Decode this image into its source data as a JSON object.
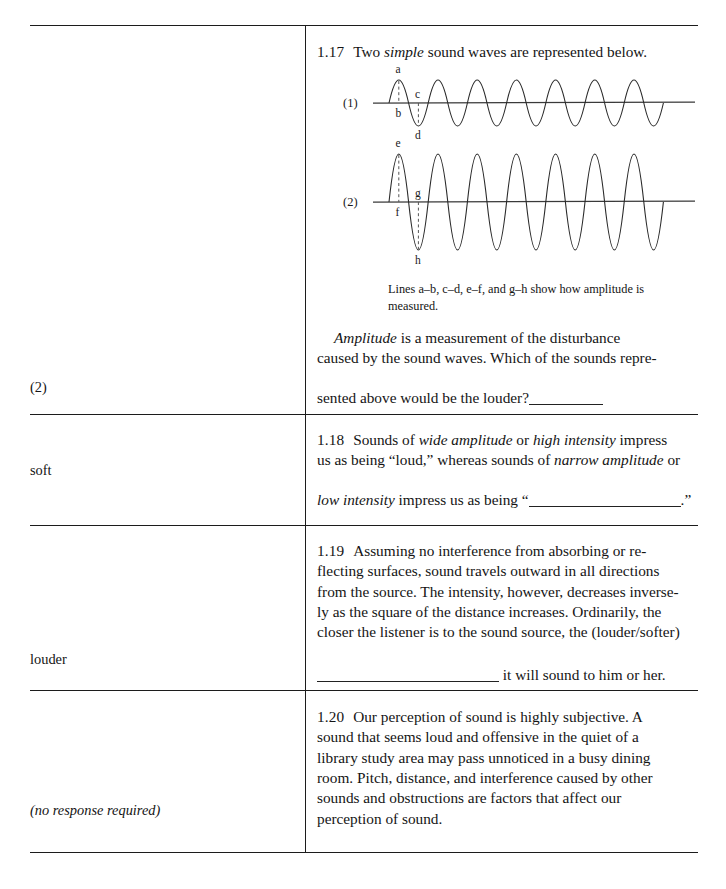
{
  "document": {
    "type": "programmed-instruction-workbook-page",
    "answer_column_header": "",
    "frames": [
      {
        "id": "1.17",
        "number": "1.17",
        "answer": "(2)",
        "answer_style": "plain",
        "lines": [
          {
            "segments": [
              {
                "text": "Two ",
                "style": "plain"
              },
              {
                "text": "simple",
                "style": "italic"
              },
              {
                "text": " sound waves are represented below.",
                "style": "plain"
              }
            ]
          }
        ],
        "figure": {
          "caption": "Lines a–b, c–d, e–f, and g–h show how amplitude is measured.",
          "waves": [
            {
              "label": "(1)",
              "cycles": 6.5,
              "amplitude_px": 23,
              "description": "narrow amplitude / low intensity wave",
              "point_labels": [
                {
                  "name": "a",
                  "position": "above first crest"
                },
                {
                  "name": "b",
                  "position": "below axis at first crest"
                },
                {
                  "name": "c",
                  "position": "above axis at first trough"
                },
                {
                  "name": "d",
                  "position": "below first trough"
                }
              ]
            },
            {
              "label": "(2)",
              "cycles": 6.5,
              "amplitude_px": 48,
              "description": "wide amplitude / high intensity wave",
              "point_labels": [
                {
                  "name": "e",
                  "position": "above first crest"
                },
                {
                  "name": "f",
                  "position": "below axis at first crest"
                },
                {
                  "name": "g",
                  "position": "above axis at first trough"
                },
                {
                  "name": "h",
                  "position": "below first trough"
                }
              ]
            }
          ]
        },
        "body": {
          "line1_italic": "Amplitude",
          "line1_rest": " is a measurement of the disturbance",
          "line2": "caused by the sound waves. Which of the sounds repre-",
          "line3": "sented above would be the louder?"
        }
      },
      {
        "id": "1.18",
        "number": "1.18",
        "answer": "soft",
        "answer_style": "plain",
        "text_line1_a": "Sounds of ",
        "text_line1_i1": "wide amplitude",
        "text_line1_b": " or ",
        "text_line1_i2": "high intensity",
        "text_line1_c": " impress",
        "text_line2": "us as being “loud,” whereas sounds of ",
        "text_line2_i": "narrow amplitude",
        "text_line2_b": " or",
        "text_line3_i": "low intensity",
        "text_line3_a": " impress us as being “",
        "text_line3_b": ".”"
      },
      {
        "id": "1.19",
        "number": "1.19",
        "answer": "louder",
        "answer_style": "plain",
        "text_line1": "Assuming no interference from absorbing or re-",
        "text_line2": "flecting surfaces, sound travels outward in all directions",
        "text_line3": "from the source. The intensity, however, decreases inverse-",
        "text_line4": "ly as the square of the distance increases. Ordinarily, the",
        "text_line5": "closer the listener is to the sound source, the (louder/softer)",
        "text_line6": " it will sound to him or her."
      },
      {
        "id": "1.20",
        "number": "1.20",
        "answer": "(no response required)",
        "answer_style": "italic",
        "text_line1": "Our perception of sound is highly subjective. A",
        "text_line2": "sound that seems loud and offensive in the quiet of a",
        "text_line3": "library study area may pass unnoticed in a busy dining",
        "text_line4": "room. Pitch, distance, and interference caused by other",
        "text_line5": "sounds and obstructions are factors that affect our",
        "text_line6": "perception of sound."
      }
    ],
    "colors": {
      "ink": "#141414",
      "rule": "#1c1c1c",
      "paper": "#ffffff"
    }
  }
}
